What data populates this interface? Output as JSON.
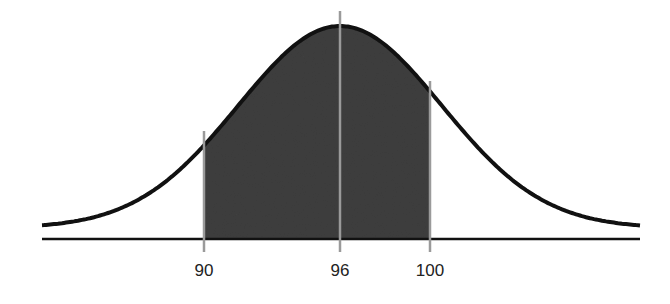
{
  "chart_data": {
    "type": "area",
    "title": "",
    "mean": 96,
    "std_dev_estimate": 4.5,
    "shaded_range": [
      90,
      100
    ],
    "markers": [
      {
        "value": 90,
        "label": "90"
      },
      {
        "value": 96,
        "label": "96"
      },
      {
        "value": 100,
        "label": "100"
      }
    ],
    "xlabel": "",
    "ylabel": "",
    "grid": false
  },
  "labels": {
    "tick_90": "90",
    "tick_96": "96",
    "tick_100": "100"
  },
  "colors": {
    "curve": "#111111",
    "shade": "#3f3f3f",
    "marker_line": "#999999",
    "baseline": "#111111"
  }
}
